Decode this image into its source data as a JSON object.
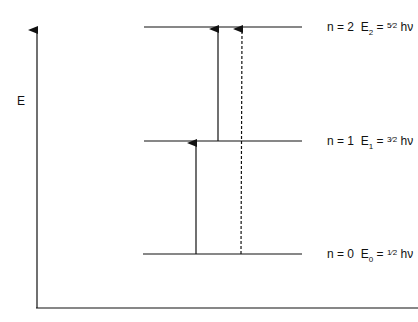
{
  "axis": {
    "y_label": "E"
  },
  "levels": [
    {
      "n_text": "n = 2",
      "E_sym": "E",
      "E_sub": "2",
      "eq": "=",
      "frac_num": "5",
      "frac_den": "2",
      "hv": "hν",
      "y": 27
    },
    {
      "n_text": "n = 1",
      "E_sym": "E",
      "E_sub": "1",
      "eq": "=",
      "frac_num": "3",
      "frac_den": "2",
      "hv": "hν",
      "y": 141
    },
    {
      "n_text": "n = 0",
      "E_sym": "E",
      "E_sub": "0",
      "eq": "=",
      "frac_num": "1",
      "frac_den": "2",
      "hv": "hν",
      "y": 254
    }
  ],
  "transitions": [
    {
      "from": 0,
      "to": 1,
      "style": "solid",
      "x": 196
    },
    {
      "from": 1,
      "to": 2,
      "style": "solid",
      "x": 218
    },
    {
      "from": 0,
      "to": 2,
      "style": "dashed",
      "x": 242
    }
  ],
  "colors": {
    "line": "#111111",
    "background": "#ffffff"
  }
}
